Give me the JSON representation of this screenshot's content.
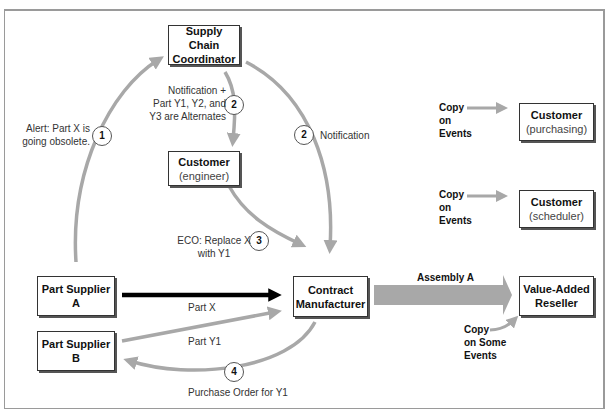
{
  "diagram": {
    "header_text": "",
    "nodes": [
      {
        "id": "supply-chain-coordinator",
        "title": "Supply Chain Coordinator",
        "line1": "Supply Chain",
        "line2": "Coordinator",
        "subtitle": ""
      },
      {
        "id": "customer-engineer",
        "title": "Customer",
        "subtitle": "(engineer)"
      },
      {
        "id": "customer-purchasing",
        "title": "Customer",
        "subtitle": "(purchasing)"
      },
      {
        "id": "customer-scheduler",
        "title": "Customer",
        "subtitle": "(scheduler)"
      },
      {
        "id": "contract-manufacturer",
        "line1": "Contract",
        "line2": "Manufacturer"
      },
      {
        "id": "value-added-reseller",
        "line1": "Value-Added",
        "line2": "Reseller"
      },
      {
        "id": "part-supplier-a",
        "title": "Part Supplier A"
      },
      {
        "id": "part-supplier-b",
        "title": "Part Supplier B"
      }
    ],
    "steps": [
      "1",
      "2",
      "2",
      "3",
      "4"
    ],
    "labels": {
      "alert": [
        "Alert: Part X is",
        "going obsolete."
      ],
      "notification_alternates": [
        "Notification +",
        "Part Y1, Y2, and",
        "Y3 are Alternates"
      ],
      "notification": "Notification",
      "eco": [
        "ECO: Replace X",
        "with Y1"
      ],
      "part_x": "Part X",
      "part_y1": "Part Y1",
      "purchase_order": "Purchase Order for Y1",
      "assembly_a": "Assembly A",
      "copy_events_1": [
        "Copy",
        "on",
        "Events"
      ],
      "copy_events_2": [
        "Copy",
        "on",
        "Events"
      ],
      "copy_some_events": [
        "Copy",
        "on Some",
        "Events"
      ]
    },
    "colors": {
      "gray_arrow": "#a8a8a8",
      "black_arrow": "#000000",
      "box_border": "#333333",
      "frame": "#9a9a9a"
    }
  }
}
